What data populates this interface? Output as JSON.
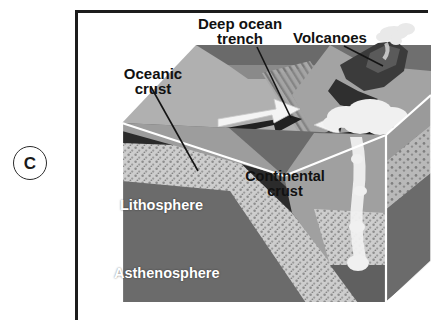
{
  "figure": {
    "panel_letter": "C",
    "background_color": "#ffffff",
    "frame_color": "#1c1c1c"
  },
  "labels": {
    "deep_ocean_trench": "Deep ocean\ntrench",
    "volcanoes": "Volcanoes",
    "oceanic_crust": "Oceanic\ncrust",
    "continental_crust": "Continental\ncrust",
    "lithosphere": "Lithosphere",
    "asthenosphere": "Asthenosphere"
  },
  "palette": {
    "ocean_surface": "#8f8f8f",
    "ocean_surface_dark": "#6e6e6e",
    "top_face_light": "#b3b3b3",
    "continent_top": "#a5a5a5",
    "side_crust": "#9b9b9b",
    "oceanic_crust_band": "#2e2e2e",
    "lithosphere_mantle": "#c9c9c9",
    "asthenosphere": "#6b6b6b",
    "right_face": "#777777",
    "volcano_rock": "#3a3a3a",
    "magma_white": "#f2f2f2",
    "arrow_white": "#f4f4f4",
    "arrow_shadow": "#161616",
    "leader_line": "#111111"
  },
  "features": [
    {
      "name": "subducting-oceanic-plate",
      "motion": "right",
      "arrow": "white-block-arrow-right"
    },
    {
      "name": "overriding-continental-plate",
      "motion": "left",
      "arrow": "white-block-arrow-left"
    },
    {
      "name": "deep-ocean-trench",
      "description": "ridged depression between plates"
    },
    {
      "name": "volcanic-arc",
      "description": "volcanic cones with rising smoke plume"
    },
    {
      "name": "rising-magma",
      "description": "white magma plume ascending through continental crust"
    }
  ]
}
